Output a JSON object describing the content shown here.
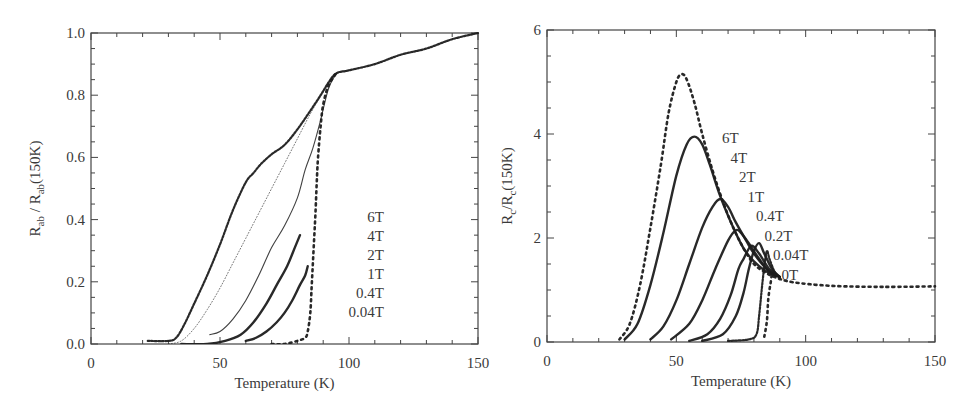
{
  "chart_data": [
    {
      "type": "scatter",
      "panel": "left",
      "title": "",
      "xlabel": "Temperature (K)",
      "ylabel": "R_ab / R_ab(150K)",
      "ylabel_parts": {
        "main": "R",
        "sub1": "ab",
        "mid": " / R",
        "sub2": "ab",
        "tail": "(150K)"
      },
      "xlim": [
        0,
        150
      ],
      "ylim": [
        0,
        1.0
      ],
      "xticks": [
        0,
        50,
        100,
        150
      ],
      "xtick_labels": [
        "0",
        "50",
        "100",
        "150"
      ],
      "yticks": [
        0,
        0.2,
        0.4,
        0.6,
        0.8,
        1.0
      ],
      "ytick_labels": [
        "0.0",
        "0.2",
        "0.4",
        "0.6",
        "0.8",
        "1.0"
      ],
      "grid": false,
      "legend": [
        "6T",
        "4T",
        "2T",
        "1T",
        "0.4T",
        "0.04T"
      ],
      "legend_position": "inside right, stacked vertically",
      "series": [
        {
          "name": "6T",
          "style": "dense-dots",
          "x": [
            22,
            30,
            33,
            36,
            40,
            45,
            50,
            55,
            60,
            63,
            66,
            70,
            75,
            80,
            85,
            89,
            92,
            95,
            100,
            110,
            120,
            130,
            140,
            150
          ],
          "y": [
            0.01,
            0.01,
            0.02,
            0.06,
            0.13,
            0.22,
            0.32,
            0.43,
            0.52,
            0.55,
            0.58,
            0.61,
            0.64,
            0.69,
            0.75,
            0.8,
            0.84,
            0.87,
            0.88,
            0.9,
            0.93,
            0.95,
            0.98,
            1.0
          ]
        },
        {
          "name": "4T",
          "style": "fine-dots",
          "x": [
            30,
            35,
            40,
            45,
            50,
            55,
            60,
            65,
            70,
            75,
            80,
            85,
            90,
            95,
            100
          ],
          "y": [
            0.0,
            0.01,
            0.05,
            0.11,
            0.18,
            0.26,
            0.34,
            0.42,
            0.5,
            0.58,
            0.66,
            0.74,
            0.81,
            0.87,
            0.88
          ]
        },
        {
          "name": "2T",
          "style": "line",
          "x": [
            46,
            50,
            55,
            60,
            65,
            70,
            75,
            80,
            83,
            86,
            89,
            92,
            95
          ],
          "y": [
            0.03,
            0.04,
            0.08,
            0.14,
            0.22,
            0.31,
            0.38,
            0.47,
            0.56,
            0.63,
            0.72,
            0.82,
            0.87
          ]
        },
        {
          "name": "1T",
          "style": "thick",
          "x": [
            35,
            45,
            52,
            58,
            63,
            68,
            72,
            76,
            79,
            81
          ],
          "y": [
            0.0,
            0.0,
            0.01,
            0.03,
            0.07,
            0.13,
            0.19,
            0.25,
            0.31,
            0.35
          ]
        },
        {
          "name": "0.4T",
          "style": "thick",
          "x": [
            60,
            64,
            68,
            72,
            75,
            78,
            81,
            83,
            84
          ],
          "y": [
            0.01,
            0.02,
            0.04,
            0.07,
            0.1,
            0.14,
            0.19,
            0.22,
            0.25
          ]
        },
        {
          "name": "0.04T",
          "style": "sparse-dots",
          "x": [
            70,
            75,
            80,
            83,
            84,
            85,
            85.5,
            86,
            86.5,
            87,
            87.5,
            88,
            89,
            90,
            92,
            95
          ],
          "y": [
            0.0,
            0.0,
            0.01,
            0.02,
            0.04,
            0.1,
            0.18,
            0.26,
            0.34,
            0.42,
            0.52,
            0.6,
            0.7,
            0.77,
            0.83,
            0.87
          ]
        }
      ]
    },
    {
      "type": "scatter",
      "panel": "right",
      "title": "",
      "xlabel": "Temperature (K)",
      "ylabel": "R_c/R_c(150K)",
      "ylabel_parts": {
        "main": "R",
        "sub1": "c",
        "mid": "/R",
        "sub2": "c",
        "tail": "(150K)"
      },
      "xlim": [
        0,
        150
      ],
      "ylim": [
        0,
        6
      ],
      "xticks": [
        0,
        50,
        100,
        150
      ],
      "xtick_labels": [
        "0",
        "50",
        "100",
        "150"
      ],
      "yticks": [
        0,
        2,
        4,
        6
      ],
      "ytick_labels": [
        "0",
        "2",
        "4",
        "6"
      ],
      "grid": false,
      "legend": [
        "6T",
        "4T",
        "2T",
        "1T",
        "0.4T",
        "0.2T",
        "0.04T",
        "0T"
      ],
      "legend_position": "inside, diagonal staircase to the right of peaks",
      "series": [
        {
          "name": "6T",
          "style": "sparse-dots",
          "x": [
            28,
            32,
            36,
            40,
            44,
            47,
            50,
            52,
            54,
            57,
            60,
            64,
            68,
            72,
            76,
            80,
            84,
            88,
            95,
            110,
            130,
            150
          ],
          "y": [
            0.05,
            0.35,
            1.1,
            2.2,
            3.4,
            4.4,
            5.0,
            5.15,
            5.05,
            4.6,
            4.0,
            3.3,
            2.7,
            2.2,
            1.8,
            1.5,
            1.35,
            1.25,
            1.15,
            1.08,
            1.06,
            1.07
          ]
        },
        {
          "name": "4T",
          "style": "thick",
          "x": [
            30,
            35,
            40,
            45,
            50,
            54,
            57,
            60,
            63,
            67,
            72,
            76,
            80,
            85,
            90
          ],
          "y": [
            0.05,
            0.35,
            1.1,
            2.1,
            3.2,
            3.8,
            3.95,
            3.8,
            3.4,
            2.8,
            2.2,
            1.8,
            1.55,
            1.35,
            1.25
          ]
        },
        {
          "name": "2T",
          "style": "thick",
          "x": [
            40,
            45,
            50,
            55,
            60,
            64,
            67,
            70,
            73,
            77,
            80,
            85,
            90
          ],
          "y": [
            0.05,
            0.3,
            0.8,
            1.5,
            2.2,
            2.6,
            2.75,
            2.6,
            2.3,
            1.95,
            1.7,
            1.4,
            1.25
          ]
        },
        {
          "name": "1T",
          "style": "thick",
          "x": [
            48,
            55,
            60,
            65,
            70,
            73,
            75,
            78,
            82,
            86,
            90
          ],
          "y": [
            0.05,
            0.35,
            0.8,
            1.4,
            1.95,
            2.15,
            2.1,
            1.9,
            1.6,
            1.35,
            1.25
          ]
        },
        {
          "name": "0.4T",
          "style": "thick",
          "x": [
            55,
            62,
            67,
            71,
            74,
            76,
            79,
            82,
            86,
            90
          ],
          "y": [
            0.02,
            0.15,
            0.45,
            0.9,
            1.4,
            1.6,
            1.85,
            1.7,
            1.4,
            1.25
          ]
        },
        {
          "name": "0.2T",
          "style": "thick",
          "x": [
            60,
            68,
            73,
            76,
            78,
            80,
            82,
            84,
            87,
            90
          ],
          "y": [
            0.02,
            0.15,
            0.5,
            0.95,
            1.4,
            1.75,
            1.9,
            1.7,
            1.4,
            1.25
          ]
        },
        {
          "name": "0.04T",
          "style": "dense-dots",
          "x": [
            70,
            78,
            81,
            82,
            83,
            84,
            85,
            86,
            88,
            90
          ],
          "y": [
            0.02,
            0.05,
            0.15,
            0.5,
            1.0,
            1.45,
            1.75,
            1.6,
            1.35,
            1.25
          ]
        },
        {
          "name": "0T",
          "style": "sparse-dots",
          "x": [
            84,
            85,
            85.5,
            86,
            86.5,
            87,
            88,
            90
          ],
          "y": [
            0.1,
            0.4,
            0.8,
            1.0,
            1.15,
            1.3,
            1.3,
            1.25
          ]
        }
      ]
    }
  ]
}
